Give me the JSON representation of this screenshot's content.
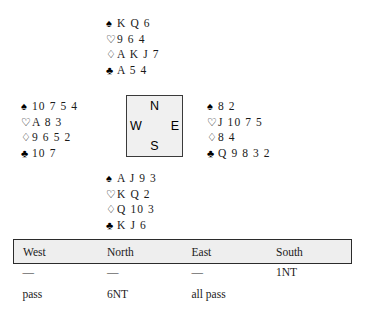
{
  "deal": {
    "suit_symbols": {
      "spade": "♠",
      "heart": "♡",
      "diamond": "♢",
      "club": "♣"
    },
    "north": {
      "label": "North",
      "spades": "K Q 6",
      "hearts": "9 6 4",
      "diamonds": "A K J 7",
      "clubs": "A 5 4"
    },
    "west": {
      "label": "West",
      "spades": "10 7 5 4",
      "hearts": "A 8 3",
      "diamonds": "9 6 5 2",
      "clubs": "10 7"
    },
    "east": {
      "label": "East",
      "spades": "8 2",
      "hearts": "J 10 7 5",
      "diamonds": "8 4",
      "clubs": "Q 9 8 3 2"
    },
    "south": {
      "label": "South",
      "spades": "A J 9 3",
      "hearts": "K Q 2",
      "diamonds": "Q 10 3",
      "clubs": "K J 6"
    }
  },
  "compass": {
    "north": "N",
    "west": "W",
    "east": "E",
    "south": "S"
  },
  "auction": {
    "headers": [
      "West",
      "North",
      "East",
      "South"
    ],
    "rows": [
      [
        "—",
        "—",
        "—",
        "1NT"
      ],
      [
        "pass",
        "6NT",
        "all pass",
        ""
      ]
    ]
  },
  "colors": {
    "ink": "#1a1a1a",
    "box_fill": "#f0f0f0",
    "box_border": "#3a3a3a",
    "table_header_fill": "#eeeeee",
    "table_border": "#2b2b2b"
  }
}
